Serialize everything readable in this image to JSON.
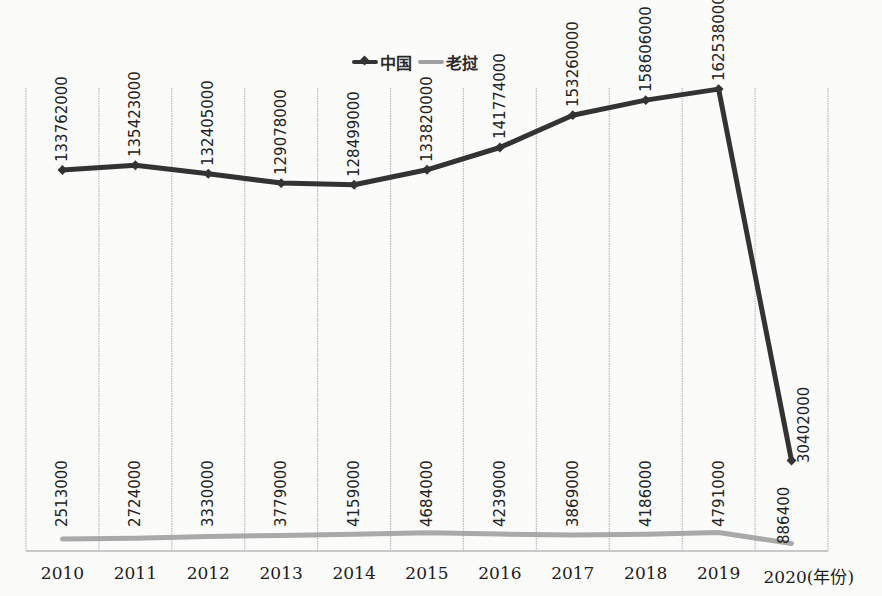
{
  "chart_data": {
    "type": "line",
    "title": "",
    "xlabel": "(年份)",
    "ylabel": "",
    "categories": [
      "2010",
      "2011",
      "2012",
      "2013",
      "2014",
      "2015",
      "2016",
      "2017",
      "2018",
      "2019",
      "2020"
    ],
    "series": [
      {
        "name": "中国",
        "color": "#333333",
        "marker": "diamond",
        "values": [
          133762000,
          135423000,
          132405000,
          129078000,
          128499000,
          133820000,
          141774000,
          153260000,
          158606000,
          162538000,
          30402000
        ],
        "labels": [
          "133762000",
          "135423000",
          "132405000",
          "129078000",
          "128499000",
          "133820000",
          "141774000",
          "153260000",
          "158606000",
          "162538000",
          "30402000"
        ]
      },
      {
        "name": "老挝",
        "color": "#a0a0a0",
        "marker": "none",
        "values": [
          2513000,
          2724000,
          3330000,
          3779000,
          4159000,
          4684000,
          4239000,
          3869000,
          4186000,
          4791000,
          886400
        ],
        "labels": [
          "2513000",
          "2724000",
          "3330000",
          "3779000",
          "4159000",
          "4684000",
          "4239000",
          "3869000",
          "4186000",
          "4791000",
          "886400"
        ]
      }
    ],
    "grid": {
      "vertical": true,
      "horizontal": false
    },
    "legend_position": "top",
    "y_axis_visible": false,
    "ylim": [
      0,
      180000000
    ]
  },
  "legend": {
    "china": "中国",
    "laos": "老挝"
  },
  "x_axis": {
    "ticks": [
      "2010",
      "2011",
      "2012",
      "2013",
      "2014",
      "2015",
      "2016",
      "2017",
      "2018",
      "2019",
      "2020(年份)"
    ]
  }
}
